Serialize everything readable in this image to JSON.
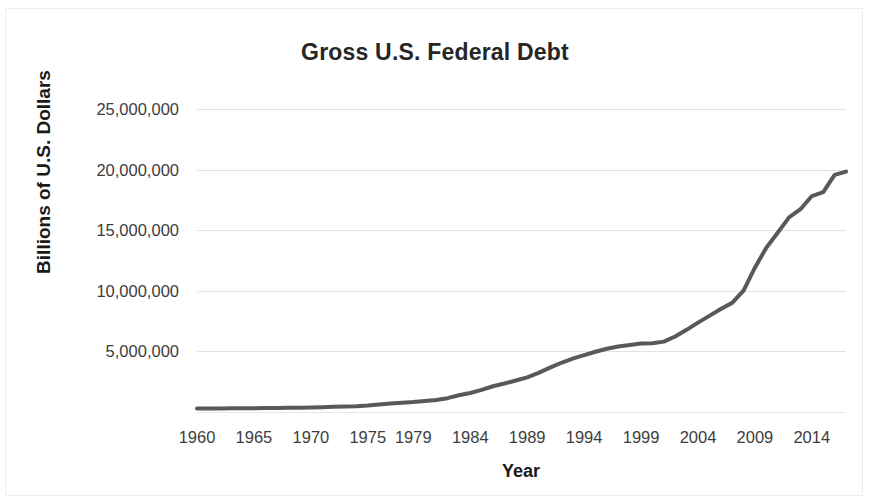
{
  "chart_data": {
    "type": "line",
    "title": "Gross U.S. Federal Debt",
    "xlabel": "Year",
    "ylabel": "Billions of U.S. Dollars",
    "xlim": [
      1960,
      2017
    ],
    "ylim": [
      0,
      26000000
    ],
    "ytick_values": [
      5000000,
      10000000,
      15000000,
      20000000,
      25000000
    ],
    "ytick_labels": [
      "5,000,000",
      "10,000,000",
      "15,000,000",
      "20,000,000",
      "25,000,000"
    ],
    "xtick_labels": [
      "1960",
      "1965",
      "1970",
      "1975",
      "1979",
      "1984",
      "1989",
      "1994",
      "1999",
      "2004",
      "2009",
      "2014"
    ],
    "xtick_years": [
      1960,
      1965,
      1970,
      1975,
      1979,
      1984,
      1989,
      1994,
      1999,
      2004,
      2009,
      2014
    ],
    "grid": "horizontal",
    "legend": "none",
    "series": [
      {
        "name": "Gross U.S. Federal Debt",
        "color": "#595959",
        "line_width": 4,
        "x": [
          1960,
          1961,
          1962,
          1963,
          1964,
          1965,
          1966,
          1967,
          1968,
          1969,
          1970,
          1971,
          1972,
          1973,
          1974,
          1975,
          1976,
          1977,
          1978,
          1979,
          1980,
          1981,
          1982,
          1983,
          1984,
          1985,
          1986,
          1987,
          1988,
          1989,
          1990,
          1991,
          1992,
          1993,
          1994,
          1995,
          1996,
          1997,
          1998,
          1999,
          2000,
          2001,
          2002,
          2003,
          2004,
          2005,
          2006,
          2007,
          2008,
          2009,
          2010,
          2011,
          2012,
          2013,
          2014,
          2015,
          2016,
          2017
        ],
        "values": [
          286300,
          288900,
          298200,
          305900,
          311700,
          317300,
          319900,
          326200,
          347600,
          353700,
          370900,
          398100,
          427300,
          458100,
          475100,
          533200,
          620400,
          698800,
          771500,
          826500,
          907700,
          997900,
          1142000,
          1377200,
          1572300,
          1823100,
          2125300,
          2350300,
          2602300,
          2857400,
          3233300,
          3665300,
          4064600,
          4411500,
          4692700,
          4973900,
          5224800,
          5413100,
          5526200,
          5656300,
          5674200,
          5807500,
          6228200,
          6783200,
          7379100,
          7932700,
          8507000,
          9007700,
          10024700,
          11909800,
          13562200,
          14790300,
          16066200,
          16738200,
          17824100,
          18150600,
          19573400,
          19844500
        ]
      }
    ]
  },
  "axes": {
    "title_text": "Gross U.S. Federal Debt",
    "y_title_text": "Billions of U.S. Dollars",
    "x_title_text": "Year"
  }
}
